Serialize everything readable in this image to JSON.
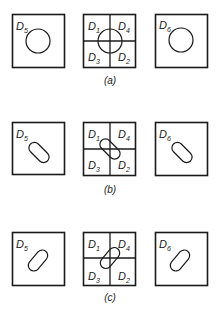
{
  "figure": {
    "rows": [
      {
        "caption": "(a)",
        "shape": "circle",
        "left": {
          "label": "D",
          "sub": "5"
        },
        "middle": {
          "quadrants": [
            {
              "label": "D",
              "sub": "1"
            },
            {
              "label": "D",
              "sub": "4"
            },
            {
              "label": "D",
              "sub": "3"
            },
            {
              "label": "D",
              "sub": "2"
            }
          ]
        },
        "right": {
          "label": "D",
          "sub": "6"
        }
      },
      {
        "caption": "(b)",
        "shape": "capsule-tilted-down-right",
        "left": {
          "label": "D",
          "sub": "5"
        },
        "middle": {
          "quadrants": [
            {
              "label": "D",
              "sub": "1"
            },
            {
              "label": "D",
              "sub": "4"
            },
            {
              "label": "D",
              "sub": "3"
            },
            {
              "label": "D",
              "sub": "2"
            }
          ]
        },
        "right": {
          "label": "D",
          "sub": "6"
        }
      },
      {
        "caption": "(c)",
        "shape": "capsule-tilted-up-right",
        "left": {
          "label": "D",
          "sub": "5"
        },
        "middle": {
          "quadrants": [
            {
              "label": "D",
              "sub": "1"
            },
            {
              "label": "D",
              "sub": "4"
            },
            {
              "label": "D",
              "sub": "3"
            },
            {
              "label": "D",
              "sub": "2"
            }
          ]
        },
        "right": {
          "label": "D",
          "sub": "6"
        }
      }
    ]
  }
}
